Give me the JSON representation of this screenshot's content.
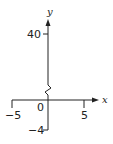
{
  "diagram": {
    "type": "coordinate-axes",
    "x_axis": {
      "label": "x",
      "ticks": [
        {
          "value": "-5",
          "label": "−5"
        },
        {
          "value": "5",
          "label": "5"
        }
      ]
    },
    "y_axis": {
      "label": "y",
      "ticks": [
        {
          "value": "40",
          "label": "40"
        },
        {
          "value": "-4",
          "label": "−4"
        }
      ],
      "axis_break": true
    },
    "origin_label": "0",
    "stroke_color": "#222222"
  }
}
